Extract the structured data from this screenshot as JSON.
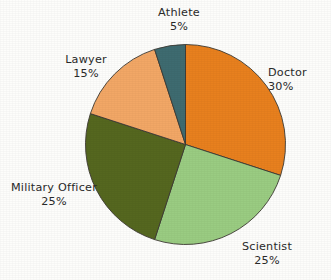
{
  "chart_data": {
    "type": "pie",
    "title": "",
    "subtitle": "",
    "xlabel": "",
    "ylabel": "",
    "legend_position": "none",
    "grid": false,
    "start_angle_deg": 0,
    "direction": "clockwise",
    "categories": [
      "Doctor",
      "Scientist",
      "Military Officer",
      "Lawyer",
      "Athlete"
    ],
    "values": [
      30,
      25,
      25,
      15,
      5
    ],
    "value_unit": "%",
    "slices": [
      {
        "label": "Doctor",
        "value": 30,
        "value_text": "30%",
        "color": "#e8801e"
      },
      {
        "label": "Scientist",
        "value": 25,
        "value_text": "25%",
        "color": "#9acc82"
      },
      {
        "label": "Military Officer",
        "value": 25,
        "value_text": "25%",
        "color": "#55671f"
      },
      {
        "label": "Lawyer",
        "value": 15,
        "value_text": "15%",
        "color": "#f2a766"
      },
      {
        "label": "Athlete",
        "value": 5,
        "value_text": "5%",
        "color": "#3e6b70"
      }
    ],
    "colors": {
      "doctor": "#e8801e",
      "scientist": "#9acc82",
      "military_officer": "#55671f",
      "lawyer": "#f2a766",
      "athlete": "#3e6b70",
      "outline": "#3d3a33",
      "text": "#2a2a2a",
      "background": "#fdfdfb"
    }
  }
}
